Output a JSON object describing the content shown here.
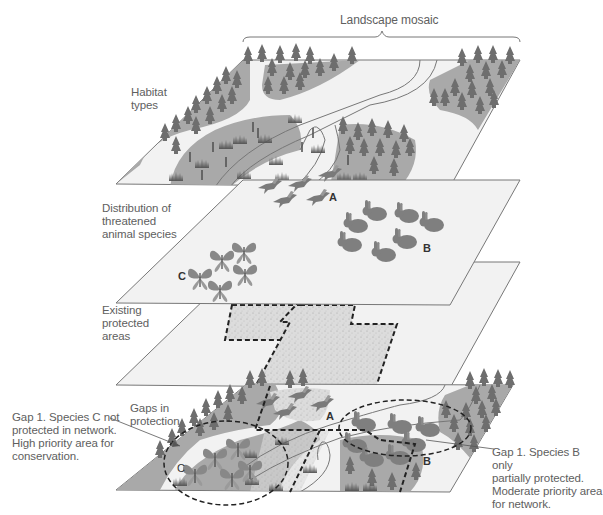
{
  "title": "Landscape mosaic",
  "layers": [
    {
      "id": "habitat",
      "label_lines": [
        "Habitat",
        "types"
      ]
    },
    {
      "id": "distribution",
      "label_lines": [
        "Distribution of",
        "threatened",
        "animal species"
      ]
    },
    {
      "id": "protected",
      "label_lines": [
        "Existing",
        "protected",
        "areas"
      ]
    },
    {
      "id": "gaps",
      "label_lines": [
        "Gaps in",
        "protection"
      ]
    }
  ],
  "species_labels": {
    "a": "A",
    "b": "B",
    "c": "C"
  },
  "species": [
    {
      "letter": "A",
      "icon": "bird",
      "count": 5
    },
    {
      "letter": "B",
      "icon": "rabbit",
      "count": 7
    },
    {
      "letter": "C",
      "icon": "butterfly",
      "count": 5
    }
  ],
  "callouts": {
    "left": [
      "Gap 1. Species C not",
      "protected in network.",
      "High priority area for",
      "conservation."
    ],
    "right": [
      "Gap 1. Species B only",
      "partially protected.",
      "Moderate priority area",
      "for network."
    ]
  },
  "colors": {
    "plane_fill": "#f2f2f2",
    "plane_stroke": "#777777",
    "habitat_dark": "#a9a9a9",
    "tree": "#6f6f6f",
    "animal": "#7d7d7d",
    "protected_fill": "#d9d9d9",
    "dash": "#222222"
  }
}
